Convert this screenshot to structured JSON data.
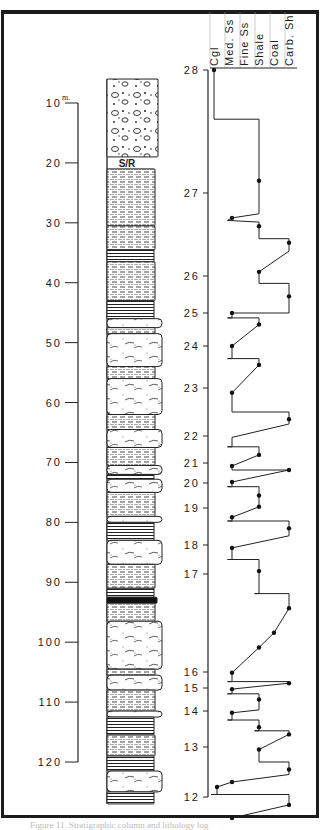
{
  "chart_data": [
    {
      "type": "table",
      "title": "Lithologic column",
      "axis": {
        "unit_label": "m.",
        "ticks": [
          10,
          20,
          30,
          40,
          50,
          60,
          70,
          80,
          90,
          100,
          110,
          120
        ],
        "range": [
          10,
          120
        ]
      },
      "annotation": "S/R",
      "beds": [
        {
          "top": 6,
          "base": 19,
          "lith": "conglomerate"
        },
        {
          "top": 19,
          "base": 21,
          "lith": "no-record",
          "label": "S/R"
        },
        {
          "top": 21,
          "base": 30.5,
          "lith": "shale"
        },
        {
          "top": 30.5,
          "base": 34.5,
          "lith": "shale"
        },
        {
          "top": 34.5,
          "base": 36.5,
          "lith": "shale-laminated"
        },
        {
          "top": 36.5,
          "base": 43,
          "lith": "shale"
        },
        {
          "top": 43,
          "base": 46,
          "lith": "shale-laminated"
        },
        {
          "top": 46,
          "base": 47.5,
          "lith": "sandstone"
        },
        {
          "top": 47.5,
          "base": 48.5,
          "lith": "shale"
        },
        {
          "top": 48.5,
          "base": 54,
          "lith": "sandstone"
        },
        {
          "top": 54,
          "base": 56,
          "lith": "shale"
        },
        {
          "top": 56,
          "base": 62,
          "lith": "sandstone"
        },
        {
          "top": 62,
          "base": 64.5,
          "lith": "shale"
        },
        {
          "top": 64.5,
          "base": 67.5,
          "lith": "sandstone"
        },
        {
          "top": 67.5,
          "base": 70.5,
          "lith": "shale"
        },
        {
          "top": 70.5,
          "base": 72,
          "lith": "sandstone"
        },
        {
          "top": 72,
          "base": 72.8,
          "lith": "shale-laminated"
        },
        {
          "top": 72.8,
          "base": 75,
          "lith": "sandstone"
        },
        {
          "top": 75,
          "base": 79,
          "lith": "shale"
        },
        {
          "top": 79,
          "base": 80,
          "lith": "sandstone"
        },
        {
          "top": 80,
          "base": 83,
          "lith": "shale-laminated"
        },
        {
          "top": 83,
          "base": 87,
          "lith": "sandstone"
        },
        {
          "top": 87,
          "base": 91,
          "lith": "shale"
        },
        {
          "top": 91,
          "base": 92.5,
          "lith": "shale-laminated"
        },
        {
          "top": 92.5,
          "base": 93.5,
          "lith": "coal"
        },
        {
          "top": 93.5,
          "base": 96.5,
          "lith": "shale"
        },
        {
          "top": 96.5,
          "base": 104.5,
          "lith": "sandstone"
        },
        {
          "top": 104.5,
          "base": 105.5,
          "lith": "shale"
        },
        {
          "top": 105.5,
          "base": 108,
          "lith": "sandstone"
        },
        {
          "top": 108,
          "base": 111.5,
          "lith": "shale"
        },
        {
          "top": 111.5,
          "base": 112.5,
          "lith": "sandstone"
        },
        {
          "top": 112.5,
          "base": 115.5,
          "lith": "shale-laminated"
        },
        {
          "top": 115.5,
          "base": 119,
          "lith": "shale"
        },
        {
          "top": 119,
          "base": 121.5,
          "lith": "shale-laminated"
        },
        {
          "top": 121.5,
          "base": 125,
          "lith": "sandstone"
        },
        {
          "top": 125,
          "base": 127,
          "lith": "shale-laminated"
        }
      ]
    },
    {
      "type": "line",
      "title": "Lithology log",
      "categories": [
        "Cgl",
        "Med. Ss",
        "Fine Ss",
        "Shale",
        "Coal",
        "Carb. Sh"
      ],
      "y_ticks": [
        28,
        27,
        26,
        25,
        24,
        23,
        22,
        21,
        20,
        19,
        18,
        17,
        16,
        15,
        14,
        13,
        12
      ],
      "ylim": [
        11.6,
        28
      ],
      "xlabel": "",
      "ylabel": "",
      "series": [
        {
          "name": "log",
          "points": [
            {
              "x": 0,
              "y": 28,
              "dot": true
            },
            {
              "x": 0,
              "y": 27.6
            },
            {
              "x": 3,
              "y": 27.6
            },
            {
              "x": 3,
              "y": 27.1,
              "dot": true
            },
            {
              "x": 3,
              "y": 26.75
            },
            {
              "x": 1.2,
              "y": 26.7,
              "dot": true
            },
            {
              "x": 0.9,
              "y": 26.67
            },
            {
              "x": 3,
              "y": 26.65
            },
            {
              "x": 3,
              "y": 26.6,
              "dot": true
            },
            {
              "x": 3,
              "y": 26.45
            },
            {
              "x": 5,
              "y": 26.45
            },
            {
              "x": 5,
              "y": 26.4,
              "dot": true
            },
            {
              "x": 5,
              "y": 26.3
            },
            {
              "x": 3,
              "y": 26.05,
              "dot": true
            },
            {
              "x": 3,
              "y": 25.8
            },
            {
              "x": 5,
              "y": 25.8
            },
            {
              "x": 5,
              "y": 25.45,
              "dot": true
            },
            {
              "x": 5,
              "y": 25.0
            },
            {
              "x": 1.2,
              "y": 25.0,
              "dot": true
            },
            {
              "x": 1.2,
              "y": 24.85
            },
            {
              "x": 0.9,
              "y": 24.85
            },
            {
              "x": 3,
              "y": 24.85
            },
            {
              "x": 3,
              "y": 24.65,
              "dot": true
            },
            {
              "x": 1.2,
              "y": 24.0,
              "dot": true
            },
            {
              "x": 1.2,
              "y": 23.7
            },
            {
              "x": 0.9,
              "y": 23.7
            },
            {
              "x": 3,
              "y": 23.7
            },
            {
              "x": 3,
              "y": 23.55,
              "dot": true
            },
            {
              "x": 1.2,
              "y": 22.9,
              "dot": true
            },
            {
              "x": 1.2,
              "y": 22.5
            },
            {
              "x": 5,
              "y": 22.5
            },
            {
              "x": 5,
              "y": 22.35,
              "dot": true
            },
            {
              "x": 5,
              "y": 22.25
            },
            {
              "x": 1.2,
              "y": 21.95
            },
            {
              "x": 1.2,
              "y": 21.6
            },
            {
              "x": 0.9,
              "y": 21.6
            },
            {
              "x": 3,
              "y": 21.6
            },
            {
              "x": 3,
              "y": 21.3,
              "dot": true
            },
            {
              "x": 1.2,
              "y": 20.85,
              "dot": true
            },
            {
              "x": 1.2,
              "y": 20.65
            },
            {
              "x": 5,
              "y": 20.65,
              "dot": true
            },
            {
              "x": 1.2,
              "y": 20.05,
              "dot": true
            },
            {
              "x": 1.2,
              "y": 19.85
            },
            {
              "x": 0.9,
              "y": 19.85
            },
            {
              "x": 3,
              "y": 19.85
            },
            {
              "x": 3,
              "y": 19.5,
              "dot": true
            },
            {
              "x": 3,
              "y": 19.05,
              "dot": true
            },
            {
              "x": 1.2,
              "y": 18.75,
              "dot": true
            },
            {
              "x": 1.2,
              "y": 18.65
            },
            {
              "x": 0.9,
              "y": 18.65
            },
            {
              "x": 5,
              "y": 18.65
            },
            {
              "x": 5,
              "y": 18.45,
              "dot": true
            },
            {
              "x": 5,
              "y": 18.25
            },
            {
              "x": 1.2,
              "y": 17.9,
              "dot": true
            },
            {
              "x": 1.2,
              "y": 17.5
            },
            {
              "x": 0.9,
              "y": 17.5
            },
            {
              "x": 3,
              "y": 17.5
            },
            {
              "x": 3,
              "y": 17.1,
              "dot": true
            },
            {
              "x": 3,
              "y": 16.8
            },
            {
              "x": 2.7,
              "y": 16.8
            },
            {
              "x": 5,
              "y": 16.8
            },
            {
              "x": 5,
              "y": 16.65,
              "dot": true
            },
            {
              "x": 4,
              "y": 16.4,
              "dot": true
            },
            {
              "x": 3,
              "y": 16.25,
              "dot": true
            },
            {
              "x": 1.2,
              "y": 15.95,
              "dot": true
            },
            {
              "x": 1.2,
              "y": 15.4
            },
            {
              "x": 0.9,
              "y": 15.4
            },
            {
              "x": 5,
              "y": 15.4
            },
            {
              "x": 5,
              "y": 15.3,
              "dot": true
            },
            {
              "x": 1.2,
              "y": 14.95,
              "dot": true
            },
            {
              "x": 1.2,
              "y": 14.75
            },
            {
              "x": 0.9,
              "y": 14.75
            },
            {
              "x": 3,
              "y": 14.75
            },
            {
              "x": 3,
              "y": 14.5,
              "dot": true
            },
            {
              "x": 3,
              "y": 14.05
            },
            {
              "x": 1.2,
              "y": 13.95,
              "dot": true
            },
            {
              "x": 1.2,
              "y": 13.75
            },
            {
              "x": 0.9,
              "y": 13.75
            },
            {
              "x": 3,
              "y": 13.75
            },
            {
              "x": 3,
              "y": 13.55,
              "dot": true
            },
            {
              "x": 3,
              "y": 13.45
            },
            {
              "x": 2.7,
              "y": 13.45
            },
            {
              "x": 5,
              "y": 13.45
            },
            {
              "x": 5,
              "y": 13.35,
              "dot": true
            },
            {
              "x": 3,
              "y": 12.95,
              "dot": true
            },
            {
              "x": 3,
              "y": 12.7
            },
            {
              "x": 5,
              "y": 12.7
            },
            {
              "x": 5,
              "y": 12.55,
              "dot": true
            },
            {
              "x": 5,
              "y": 12.45
            },
            {
              "x": 1.2,
              "y": 12.3,
              "dot": true
            },
            {
              "x": 0.2,
              "y": 12.2,
              "dot": true
            },
            {
              "x": 0.2,
              "y": 12.05
            },
            {
              "x": -0.2,
              "y": 12.05
            },
            {
              "x": 5,
              "y": 12.05
            },
            {
              "x": 5,
              "y": 11.85,
              "dot": true
            },
            {
              "x": 1.2,
              "y": 11.6,
              "dot": true
            }
          ]
        }
      ]
    }
  ],
  "caption": "Figure 11. Stratigraphic column and lithology log"
}
